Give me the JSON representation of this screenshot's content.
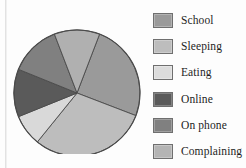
{
  "chart_data": {
    "type": "pie",
    "title": "",
    "categories": [
      "School",
      "Sleeping",
      "Eating",
      "Online",
      "On phone",
      "Complaining"
    ],
    "values": [
      25,
      30,
      8,
      12,
      13,
      12
    ],
    "legend_position": "right",
    "grid": false,
    "slice_colors": [
      "#9a9a9a",
      "#bdbdbd",
      "#d9d9d9",
      "#5a5a5a",
      "#808080",
      "#b0b0b0"
    ],
    "outline_color": "#4a4a4a",
    "slices": [
      {
        "label": "School",
        "value": 25,
        "color": "#9a9a9a",
        "start_angle": 21,
        "end_angle": 111
      },
      {
        "label": "Sleeping",
        "value": 30,
        "color": "#bdbdbd",
        "start_angle": 111,
        "end_angle": 219
      },
      {
        "label": "Eating",
        "value": 8,
        "color": "#d9d9d9",
        "start_angle": 219,
        "end_angle": 248
      },
      {
        "label": "Online",
        "value": 12,
        "color": "#5a5a5a",
        "start_angle": 248,
        "end_angle": 292
      },
      {
        "label": "On phone",
        "value": 13,
        "color": "#808080",
        "start_angle": 292,
        "end_angle": 339
      },
      {
        "label": "Complaining",
        "value": 12,
        "color": "#b0b0b0",
        "start_angle": 339,
        "end_angle": 21
      }
    ]
  },
  "legend": {
    "items": [
      {
        "label": "School",
        "color": "#9a9a9a"
      },
      {
        "label": "Sleeping",
        "color": "#bdbdbd"
      },
      {
        "label": "Eating",
        "color": "#dcdcdc"
      },
      {
        "label": "Online",
        "color": "#5a5a5a"
      },
      {
        "label": "On phone",
        "color": "#808080"
      },
      {
        "label": "Complaining",
        "color": "#b4b4b4"
      }
    ]
  }
}
